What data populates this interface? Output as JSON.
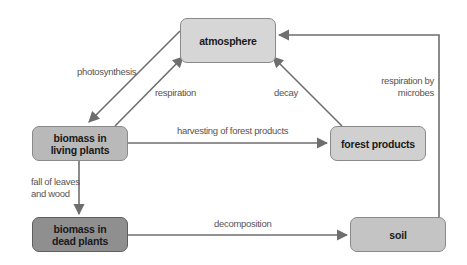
{
  "diagram": {
    "colors": {
      "arrow": "#6e6e6e",
      "node_light": "#d6d6d6",
      "node_medium": "#b9b9b9",
      "node_dark": "#8f8f8f",
      "node_soil": "#c4c4c4",
      "label_text": "#555555"
    },
    "nodes": {
      "atmosphere": {
        "label": "atmosphere"
      },
      "living_plants": {
        "label_line1": "biomass in",
        "label_line2": "living plants"
      },
      "dead_plants": {
        "label_line1": "biomass in",
        "label_line2": "dead plants"
      },
      "forest_products": {
        "label": "forest products"
      },
      "soil": {
        "label": "soil"
      }
    },
    "edges": {
      "photosynthesis": {
        "label": "photosynthesis",
        "from": "atmosphere",
        "to": "biomass in living plants"
      },
      "respiration": {
        "label": "respiration",
        "from": "biomass in living plants",
        "to": "atmosphere"
      },
      "decay": {
        "label": "decay",
        "from": "forest products",
        "to": "atmosphere"
      },
      "respiration_microbes": {
        "label_line1": "respiration by",
        "label_line2": "microbes",
        "from": "soil",
        "to": "atmosphere"
      },
      "harvesting": {
        "label": "harvesting of forest products",
        "from": "biomass in living plants",
        "to": "forest products"
      },
      "fall": {
        "label_line1": "fall of leaves",
        "label_line2": "and wood",
        "from": "biomass in living plants",
        "to": "biomass in dead plants"
      },
      "decomposition": {
        "label": "decomposition",
        "from": "biomass in dead plants",
        "to": "soil"
      }
    }
  }
}
